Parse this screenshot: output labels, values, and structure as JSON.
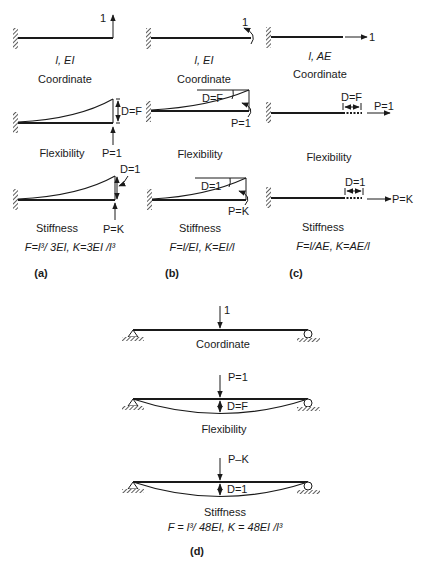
{
  "panels": {
    "a": {
      "label": "(a)",
      "coord": {
        "load": "1",
        "props": "l, EI",
        "title": "Coordinate"
      },
      "flex": {
        "disp": "D=F",
        "load": "P=1",
        "title": "Flexibility"
      },
      "stiff": {
        "disp": "D=1",
        "load": "P=K",
        "title": "Stiffness"
      },
      "formula": "F=l³/ 3EI, K=3EI /l³"
    },
    "b": {
      "label": "(b)",
      "coord": {
        "load": "1",
        "props": "l, EI",
        "title": "Coordinate"
      },
      "flex": {
        "disp": "D=F",
        "load": "P=1",
        "title": "Flexibility"
      },
      "stiff": {
        "disp": "D=1",
        "load": "P=K",
        "title": "Stiffness"
      },
      "formula": "F=l/EI, K=EI/l"
    },
    "c": {
      "label": "(c)",
      "coord": {
        "load": "1",
        "props": "l, AE",
        "title": "Coordinate"
      },
      "flex": {
        "disp": "D=F",
        "load": "P=1",
        "title": "Flexibility"
      },
      "stiff": {
        "disp": "D=1",
        "load": "P=K",
        "title": "Stiffness"
      },
      "formula": "F=l/AE, K=AE/l"
    },
    "d": {
      "label": "(d)",
      "coord": {
        "load": "1",
        "title": "Coordinate"
      },
      "flex": {
        "disp": "D=F",
        "load": "P=1",
        "title": "Flexibility"
      },
      "stiff": {
        "disp": "D=1",
        "load": "P–K",
        "title": "Stiffness"
      },
      "formula": "F = l³/ 48EI, K = 48EI /l³"
    }
  }
}
